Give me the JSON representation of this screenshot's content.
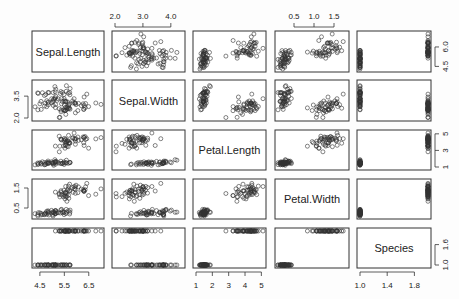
{
  "chart_data": {
    "type": "scatter",
    "title": "",
    "layout": "pairs-matrix 5x5",
    "variables": [
      "Sepal.Length",
      "Sepal.Width",
      "Petal.Length",
      "Petal.Width",
      "Species"
    ],
    "ranges": {
      "Sepal.Length": [
        4.3,
        7.0
      ],
      "Sepal.Width": [
        2.0,
        4.4
      ],
      "Petal.Length": [
        1.0,
        5.1
      ],
      "Petal.Width": [
        0.1,
        1.8
      ],
      "Species": [
        1,
        2
      ]
    },
    "ticks": {
      "Sepal.Length": [
        "4.5",
        "5.5",
        "6.5"
      ],
      "Sepal.Width": [
        "2.0",
        "3.0",
        "4.0"
      ],
      "Petal.Length": [
        "1",
        "2",
        "3",
        "4",
        "5"
      ],
      "Petal.Width": [
        "0.5",
        "1.0",
        "1.5"
      ],
      "Species": [
        "1.0",
        "1.4",
        "1.8"
      ]
    },
    "side_ticks": {
      "Sepal.Length": [
        "4.5",
        "6.0"
      ],
      "Sepal.Width": [
        "2.0",
        "3.5"
      ],
      "Petal.Length": [
        "1",
        "3",
        "5"
      ],
      "Petal.Width": [
        "0.5",
        "1.5"
      ],
      "Species": [
        "1.0",
        "1.6"
      ]
    },
    "groups": [
      {
        "species": 1,
        "n": 50,
        "mean": [
          5.0,
          3.4,
          1.46,
          0.25
        ],
        "sd": [
          0.35,
          0.38,
          0.17,
          0.1
        ]
      },
      {
        "species": 2,
        "n": 50,
        "mean": [
          5.9,
          2.77,
          4.26,
          1.33
        ],
        "sd": [
          0.5,
          0.31,
          0.47,
          0.2
        ]
      }
    ],
    "grid": false,
    "legend": null
  },
  "labels": {
    "v0": "Sepal.Length",
    "v1": "Sepal.Width",
    "v2": "Petal.Length",
    "v3": "Petal.Width",
    "v4": "Species"
  }
}
